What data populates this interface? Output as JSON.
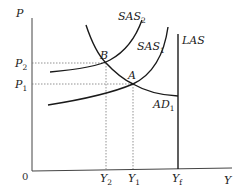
{
  "diagram": {
    "type": "AS-AD economics diagram",
    "axes": {
      "y_label": "P",
      "x_label": "Y",
      "origin_label": "0"
    },
    "price_levels": [
      {
        "base": "P",
        "sub": "2"
      },
      {
        "base": "P",
        "sub": "1"
      }
    ],
    "output_levels": [
      {
        "base": "Y",
        "sub": "2"
      },
      {
        "base": "Y",
        "sub": "1"
      },
      {
        "base": "Y",
        "sub": "f"
      }
    ],
    "curves": [
      {
        "id": "SAS2",
        "base": "SAS",
        "sub": "2"
      },
      {
        "id": "SAS1",
        "base": "SAS",
        "sub": "1"
      },
      {
        "id": "LAS",
        "base": "LAS",
        "sub": ""
      },
      {
        "id": "AD1",
        "base": "AD",
        "sub": "1"
      }
    ],
    "points": [
      {
        "label": "B"
      },
      {
        "label": "A"
      }
    ],
    "colors": {
      "curve": "#1a1a1a",
      "axis": "#333333",
      "guide": "#888888"
    }
  }
}
